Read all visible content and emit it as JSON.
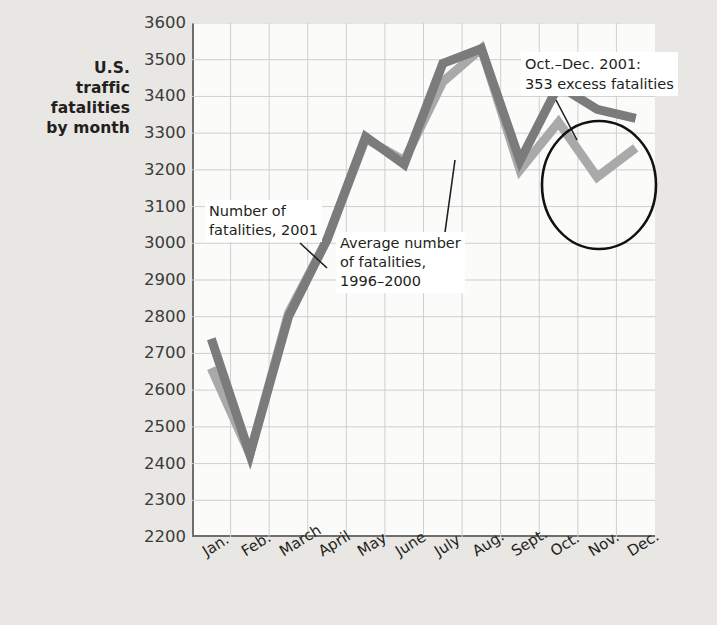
{
  "title": {
    "lines": [
      "U.S.",
      "traffic",
      "fatalities",
      "by month"
    ]
  },
  "colors": {
    "series_2001": "#7b7b7b",
    "series_average": "#a9a9a9",
    "grid": "#cfcfcf",
    "axis": "#6e6e6e",
    "background": "#e9e7e4",
    "plot_background": "#fbfbfa",
    "annotation_circle": "#111111"
  },
  "annotations": {
    "series_2001_label": [
      "Number of",
      "fatalities, 2001"
    ],
    "series_average_label": [
      "Average number",
      "of fatalities,",
      "1996–2000"
    ],
    "excess_label": [
      "Oct.–Dec. 2001:",
      "353 excess fatalities"
    ]
  },
  "chart_data": {
    "type": "line",
    "title": "U.S. traffic fatalities by month",
    "xlabel": "",
    "ylabel": "U.S. traffic fatalities by month",
    "ylim": [
      2200,
      3600
    ],
    "ytick_step": 100,
    "yticks": [
      3600,
      3500,
      3400,
      3300,
      3200,
      3100,
      3000,
      2900,
      2800,
      2700,
      2600,
      2500,
      2400,
      2300,
      2200
    ],
    "grid": true,
    "legend": "inline-annotations",
    "categories": [
      "Jan.",
      "Feb.",
      "March",
      "April",
      "May",
      "June",
      "July",
      "Aug.",
      "Sept.",
      "Oct.",
      "Nov.",
      "Dec."
    ],
    "series": [
      {
        "name": "Number of fatalities, 2001",
        "color": "#7b7b7b",
        "values": [
          2740,
          2425,
          2800,
          3010,
          3290,
          3215,
          3490,
          3530,
          3225,
          3430,
          3365,
          3340
        ]
      },
      {
        "name": "Average number of fatalities, 1996–2000",
        "color": "#a9a9a9",
        "values": [
          2660,
          2425,
          2810,
          3010,
          3285,
          3225,
          3440,
          3530,
          3200,
          3330,
          3180,
          3260
        ]
      }
    ],
    "annotations": [
      {
        "text": "Oct.–Dec. 2001: 353 excess fatalities",
        "highlight": "circle",
        "covers": [
          "Oct.",
          "Nov.",
          "Dec."
        ]
      }
    ]
  }
}
